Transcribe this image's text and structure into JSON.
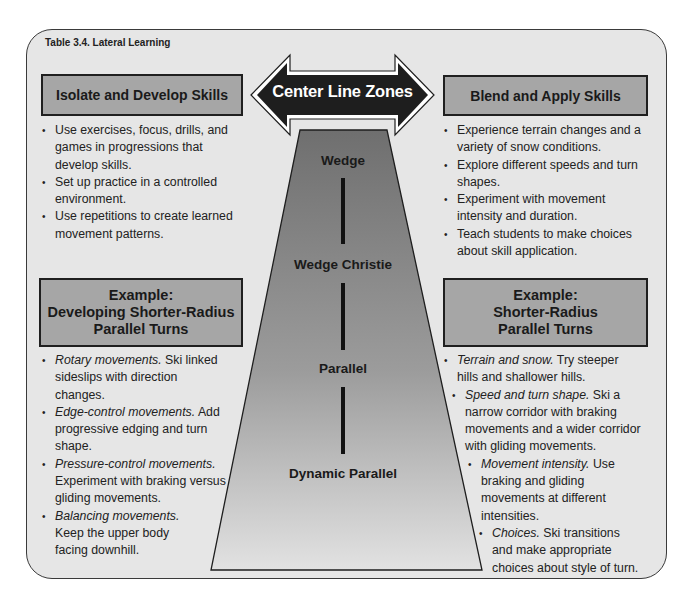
{
  "table_title": "Table 3.4. Lateral Learning",
  "center": {
    "arrow_label": "Center Line Zones",
    "zones": [
      "Wedge",
      "Wedge Christie",
      "Parallel",
      "Dynamic Parallel"
    ]
  },
  "left": {
    "header": "Isolate and Develop Skills",
    "bullets": [
      "Use exercises, focus, drills, and games in progressions that develop skills.",
      "Set up practice in a controlled environment.",
      "Use repetitions to create learned movement patterns."
    ],
    "example": {
      "line1": "Example:",
      "line2": "Developing Shorter-Radius",
      "line3": "Parallel Turns"
    },
    "example_bullets": [
      {
        "term": "Rotary movements.",
        "text": "Ski linked sideslips with direction changes."
      },
      {
        "term": "Edge-control movements.",
        "text": "Add progressive edging and turn shape."
      },
      {
        "term": "Pressure-control movements.",
        "text": "Experiment with braking versus gliding movements."
      },
      {
        "term": "Balancing movements.",
        "text": "Keep the upper body facing downhill."
      }
    ]
  },
  "right": {
    "header": "Blend and Apply Skills",
    "bullets": [
      "Experience terrain changes and a variety of snow conditions.",
      "Explore different speeds and turn shapes.",
      "Experiment with movement intensity and duration.",
      "Teach students to make choices about skill application."
    ],
    "example": {
      "line1": "Example:",
      "line2": "Shorter-Radius",
      "line3": "Parallel Turns"
    },
    "example_bullets": [
      {
        "term": "Terrain and snow.",
        "text": "Try steeper hills and shallower hills."
      },
      {
        "term": "Speed and turn shape.",
        "text": "Ski a narrow corridor with braking movements and a wider corridor with gliding movements."
      },
      {
        "term": "Movement intensity.",
        "text": "Use braking and gliding movements at different intensities."
      },
      {
        "term": "Choices.",
        "text": "Ski transitions and make appropriate choices about style of turn."
      }
    ]
  },
  "colors": {
    "panel_bg": "#e6e6e6",
    "header_box_bg": "#a6a6a6",
    "arrow_fill": "#1e1e1e",
    "trapezoid_top": "#6f6f6f",
    "trapezoid_bottom": "#e2e2e2"
  }
}
